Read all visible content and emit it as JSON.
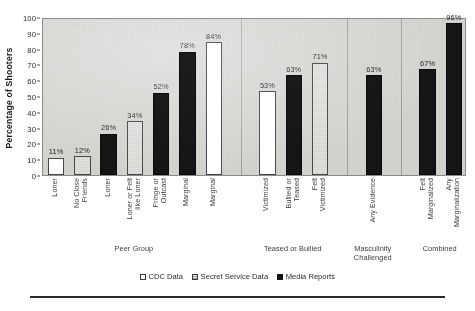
{
  "axis": {
    "y_title": "Percentage of Shooters",
    "y_ticks": [
      "0",
      "10",
      "20",
      "30",
      "40",
      "50",
      "60",
      "70",
      "80",
      "90",
      "100"
    ]
  },
  "legend": {
    "items": [
      {
        "label": "CDC Data",
        "key": "cdc",
        "swatch": "open-square-swatch"
      },
      {
        "label": "Secret Service Data",
        "key": "ss",
        "swatch": "hatched-square-swatch"
      },
      {
        "label": "Media Reports",
        "key": "media",
        "swatch": "filled-square-swatch"
      }
    ]
  },
  "chart_data": {
    "type": "bar",
    "title": "",
    "xlabel": "",
    "ylabel": "Percentage of Shooters",
    "ylim": [
      0,
      100
    ],
    "ytick_step": 10,
    "grid": false,
    "legend_position": "bottom",
    "series_names": [
      "CDC Data",
      "Secret Service Data",
      "Media Reports"
    ],
    "groups": [
      {
        "name": "Peer Group",
        "bars": [
          {
            "category": "Loner",
            "value": 11,
            "label": "11%",
            "series": "CDC Data"
          },
          {
            "category": "No Close Friends",
            "value": 12,
            "label": "12%",
            "series": "Secret Service Data"
          },
          {
            "category": "Loner",
            "value": 26,
            "label": "26%",
            "series": "Media Reports"
          },
          {
            "category": "Loner or Felt like Loner",
            "value": 34,
            "label": "34%",
            "series": "Secret Service Data"
          },
          {
            "category": "Fringe or Outcast",
            "value": 52,
            "label": "52%",
            "series": "Media Reports"
          },
          {
            "category": "Marginal",
            "value": 78,
            "label": "78%",
            "series": "Media Reports"
          },
          {
            "category": "Marginal",
            "value": 84,
            "label": "84%",
            "series": "CDC Data"
          }
        ]
      },
      {
        "name": "Teased or Bullied",
        "bars": [
          {
            "category": "Victimized",
            "value": 53,
            "label": "53%",
            "series": "CDC Data"
          },
          {
            "category": "Bullied or Teased",
            "value": 63,
            "label": "63%",
            "series": "Media Reports"
          },
          {
            "category": "Felt Victimized",
            "value": 71,
            "label": "71%",
            "series": "Secret Service Data"
          }
        ]
      },
      {
        "name": "Masculinity Challenged",
        "bars": [
          {
            "category": "Any Evidence",
            "value": 63,
            "label": "63%",
            "series": "Media Reports"
          }
        ]
      },
      {
        "name": "Combined",
        "bars": [
          {
            "category": "Felt Marginalized",
            "value": 67,
            "label": "67%",
            "series": "Media Reports"
          },
          {
            "category": "Any Marginalization",
            "value": 96,
            "label": "96%",
            "series": "Media Reports"
          }
        ]
      }
    ]
  }
}
